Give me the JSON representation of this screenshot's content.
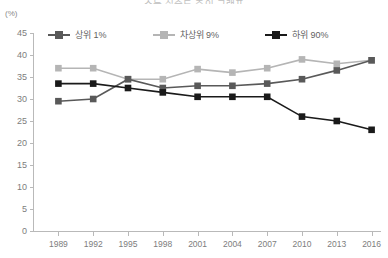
{
  "title": "소득 집중도 추이 그래프",
  "unit": "(%)",
  "legend": [
    {
      "label": "상위 1%",
      "color": "#595959",
      "name": "legend-item-top1"
    },
    {
      "label": "차상위 9%",
      "color": "#b5b5b5",
      "name": "legend-item-next9"
    },
    {
      "label": "하위 90%",
      "color": "#1a1a1a",
      "name": "legend-item-bottom90"
    }
  ],
  "chart_data": {
    "type": "line",
    "title": "소득 집중도 추이 그래프",
    "xlabel": "",
    "ylabel": "(%)",
    "ylim": [
      0,
      45
    ],
    "ytick_labels": [
      "0",
      "5",
      "10",
      "15",
      "20",
      "25",
      "30",
      "35",
      "40",
      "45"
    ],
    "ytick_values": [
      0,
      5,
      10,
      15,
      20,
      25,
      30,
      35,
      40,
      45
    ],
    "grid": false,
    "legend_position": "top",
    "categories": [
      "1989",
      "1992",
      "1995",
      "1998",
      "2001",
      "2004",
      "2007",
      "2010",
      "2013",
      "2016"
    ],
    "x": [
      1989,
      1992,
      1995,
      1998,
      2001,
      2004,
      2007,
      2010,
      2013,
      2016
    ],
    "series": [
      {
        "name": "상위 1%",
        "color": "#595959",
        "values": [
          29.5,
          30.0,
          34.5,
          32.5,
          33.0,
          33.0,
          33.5,
          34.5,
          36.5,
          38.8
        ]
      },
      {
        "name": "차상위 9%",
        "color": "#b5b5b5",
        "values": [
          37.0,
          37.0,
          34.5,
          34.5,
          36.8,
          36.0,
          37.0,
          39.0,
          38.0,
          38.8
        ]
      },
      {
        "name": "하위 90%",
        "color": "#1a1a1a",
        "values": [
          33.5,
          33.5,
          32.5,
          31.5,
          30.5,
          30.5,
          30.5,
          26.0,
          25.0,
          23.0
        ]
      }
    ]
  }
}
